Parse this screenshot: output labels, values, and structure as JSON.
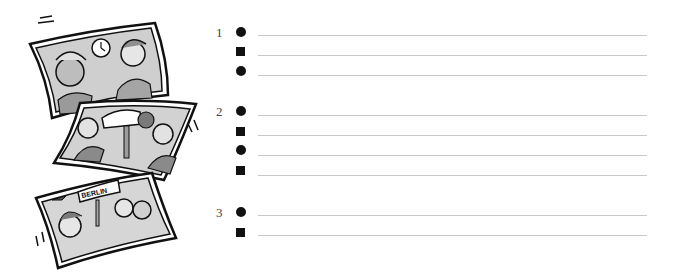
{
  "illustration": {
    "panels": [
      {
        "description": "woman and man talking, clock on wall",
        "icon": "clock-icon"
      },
      {
        "description": "two men pointing at a car on a lift in a garage",
        "icon": "car-icon"
      },
      {
        "description": "woman and travelers under BERLIN sign, airplane",
        "sign_text": "BERLIN",
        "icon": "airplane-icon"
      }
    ]
  },
  "exercise": {
    "groups": [
      {
        "number": "1",
        "items": [
          {
            "marker": "circle",
            "answer": ""
          },
          {
            "marker": "square",
            "answer": ""
          },
          {
            "marker": "circle",
            "answer": ""
          }
        ]
      },
      {
        "number": "2",
        "items": [
          {
            "marker": "circle",
            "answer": ""
          },
          {
            "marker": "square",
            "answer": ""
          },
          {
            "marker": "circle",
            "answer": ""
          },
          {
            "marker": "square",
            "answer": ""
          }
        ]
      },
      {
        "number": "3",
        "items": [
          {
            "marker": "circle",
            "answer": ""
          },
          {
            "marker": "square",
            "answer": ""
          }
        ]
      }
    ]
  }
}
